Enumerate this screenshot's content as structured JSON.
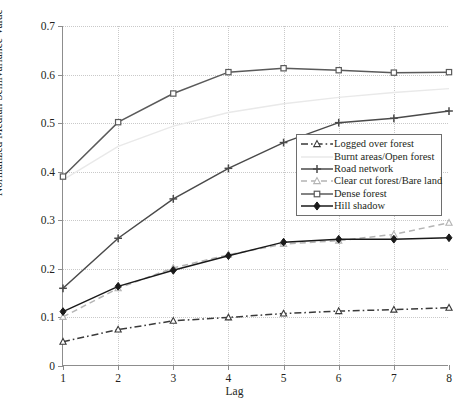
{
  "chart_data": {
    "type": "line",
    "title": "",
    "xlabel": "Lag",
    "ylabel": "Normalized Median Semivariance Value",
    "x": [
      1,
      2,
      3,
      4,
      5,
      6,
      7,
      8
    ],
    "xlim": [
      1,
      8
    ],
    "ylim": [
      0,
      0.7
    ],
    "xticks": [
      "1",
      "2",
      "3",
      "4",
      "5",
      "6",
      "7",
      "8"
    ],
    "yticks": [
      "0",
      "0.1",
      "0.2",
      "0.3",
      "0.4",
      "0.5",
      "0.6",
      "0.7"
    ],
    "ytick_values": [
      0,
      0.1,
      0.2,
      0.3,
      0.4,
      0.5,
      0.6,
      0.7
    ],
    "grid": "dotted",
    "legend_position": "center-right",
    "series": [
      {
        "name": "Logged over forest",
        "values": [
          0.05,
          0.075,
          0.093,
          0.1,
          0.108,
          0.113,
          0.116,
          0.12
        ],
        "color": "#3a3a3a",
        "line_style": "dashdot",
        "marker": "triangle-open"
      },
      {
        "name": "Burnt areas/Open forest",
        "values": [
          0.383,
          0.452,
          0.494,
          0.522,
          0.54,
          0.553,
          0.563,
          0.571
        ],
        "color": "#e9e9e9",
        "line_style": "solid",
        "marker": "none"
      },
      {
        "name": "Road network",
        "values": [
          0.16,
          0.263,
          0.344,
          0.407,
          0.46,
          0.501,
          0.51,
          0.525
        ],
        "color": "#4a4a4a",
        "line_style": "solid",
        "marker": "plus"
      },
      {
        "name": "Clear cut forest/Bare land",
        "values": [
          0.101,
          0.16,
          0.202,
          0.229,
          0.251,
          0.258,
          0.271,
          0.295
        ],
        "color": "#b4b4b4",
        "line_style": "dashed",
        "marker": "triangle-open"
      },
      {
        "name": "Dense forest",
        "values": [
          0.39,
          0.502,
          0.561,
          0.605,
          0.613,
          0.609,
          0.604,
          0.605
        ],
        "color": "#5a5a5a",
        "line_style": "solid",
        "marker": "square-open"
      },
      {
        "name": "Hill shadow",
        "values": [
          0.112,
          0.164,
          0.197,
          0.227,
          0.255,
          0.261,
          0.261,
          0.264
        ],
        "color": "#1a1a1a",
        "line_style": "solid",
        "marker": "diamond-filled"
      }
    ]
  }
}
